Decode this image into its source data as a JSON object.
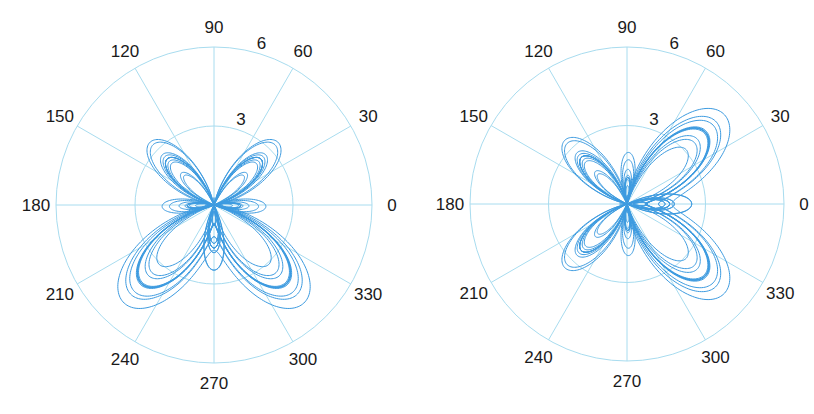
{
  "chart_data": [
    {
      "type": "polar-line",
      "title": "",
      "curve": "butterfly curve r(t) = e^{sin t} - 2cos(4t) + sin^5((2t - pi)/24), rotated with wings pointing right",
      "rotation_deg": -90,
      "theta_ticks": [
        "0",
        "30",
        "60",
        "90",
        "120",
        "150",
        "180",
        "210",
        "240",
        "270",
        "300",
        "330"
      ],
      "r_ticks": [
        "3",
        "6"
      ],
      "rlim": [
        0,
        6
      ],
      "grid": true,
      "series": [
        {
          "name": "butterfly-left",
          "color": "#3d9be0"
        }
      ],
      "geometry": {
        "cx": 214,
        "cy": 205,
        "R": 158
      }
    },
    {
      "type": "polar-line",
      "title": "",
      "curve": "butterfly curve r(t) = e^{sin t} - 2cos(4t) + sin^5((2t - pi)/24), wings pointing up",
      "rotation_deg": 0,
      "theta_ticks": [
        "0",
        "30",
        "60",
        "90",
        "120",
        "150",
        "180",
        "210",
        "240",
        "270",
        "300",
        "330"
      ],
      "r_ticks": [
        "3",
        "6"
      ],
      "rlim": [
        0,
        6
      ],
      "grid": true,
      "series": [
        {
          "name": "butterfly-right",
          "color": "#3d9be0"
        }
      ],
      "geometry": {
        "cx": 627,
        "cy": 204,
        "R": 157
      }
    }
  ],
  "colors": {
    "grid": "#a8dcef",
    "curve": "#3d9be0",
    "text": "#1a1a1a"
  }
}
